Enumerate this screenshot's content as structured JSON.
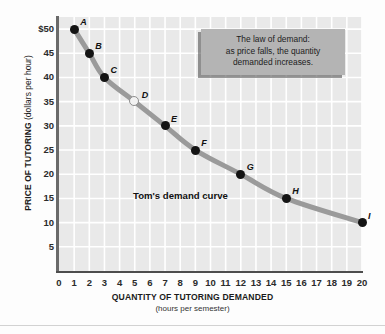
{
  "chart_data": {
    "type": "line",
    "title": "",
    "xlabel": "QUANTITY OF TUTORING DEMANDED",
    "xlabel_sub": "(hours per semester)",
    "ylabel": "PRICE OF TUTORING",
    "ylabel_sub": "(dollars per hour)",
    "xlim": [
      0,
      20
    ],
    "ylim": [
      0,
      52.5
    ],
    "grid": true,
    "legend_position": "none",
    "series_label": "Tom's demand curve",
    "x_ticks": [
      "0",
      "1",
      "2",
      "3",
      "4",
      "5",
      "6",
      "7",
      "8",
      "9",
      "10",
      "11",
      "12",
      "13",
      "14",
      "15",
      "16",
      "17",
      "18",
      "19",
      "20"
    ],
    "x_tick_values": [
      0,
      1,
      2,
      3,
      4,
      5,
      6,
      7,
      8,
      9,
      10,
      11,
      12,
      13,
      14,
      15,
      16,
      17,
      18,
      19,
      20
    ],
    "y_ticks": [
      "$50",
      "45",
      "40",
      "35",
      "30",
      "25",
      "20",
      "15",
      "10",
      "5"
    ],
    "y_tick_values": [
      50,
      45,
      40,
      35,
      30,
      25,
      20,
      15,
      10,
      5
    ],
    "points": [
      {
        "label": "A",
        "x": 1,
        "y": 50,
        "style": "filled"
      },
      {
        "label": "B",
        "x": 2,
        "y": 45,
        "style": "filled"
      },
      {
        "label": "C",
        "x": 3,
        "y": 40,
        "style": "filled"
      },
      {
        "label": "D",
        "x": 5,
        "y": 35,
        "style": "hollow"
      },
      {
        "label": "E",
        "x": 7,
        "y": 30,
        "style": "filled"
      },
      {
        "label": "F",
        "x": 9,
        "y": 25,
        "style": "filled"
      },
      {
        "label": "G",
        "x": 12,
        "y": 20,
        "style": "filled"
      },
      {
        "label": "H",
        "x": 15,
        "y": 15,
        "style": "filled"
      },
      {
        "label": "I",
        "x": 20,
        "y": 10,
        "style": "filled"
      }
    ],
    "colors": {
      "curve": "#9a9a9a",
      "point": "#141414",
      "plot_background": "#e9e9e9",
      "gridline": "#ffffff",
      "axis": "#4d4d4d",
      "callout_background": "#b4b4b4"
    }
  },
  "callout": {
    "line1": "The law of demand:",
    "line2": "as price falls, the quantity",
    "line3": "demanded increases."
  }
}
